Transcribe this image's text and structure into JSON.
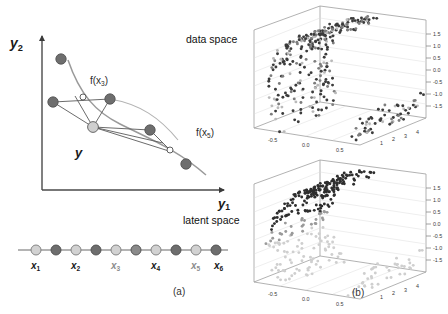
{
  "figure": {
    "caption_a": "(a)",
    "caption_b": "(b)"
  },
  "panel_a": {
    "title_data_space": "data space",
    "title_latent_space": "latent space",
    "axis_y2": "y",
    "axis_y2_sub": "2",
    "axis_y1": "y",
    "axis_y1_sub": "1",
    "point_y_label": "y",
    "map_label_1": "f(x",
    "map_label_1_sub": "3",
    "map_label_1_close": ")",
    "map_label_2": "f(x",
    "map_label_2_sub": "5",
    "map_label_2_close": ")",
    "latent_points": [
      {
        "label": "x",
        "sub": "1"
      },
      {
        "label": "x",
        "sub": "2"
      },
      {
        "label": "x",
        "sub": "3"
      },
      {
        "label": "x",
        "sub": "4"
      },
      {
        "label": "x",
        "sub": "5"
      },
      {
        "label": "x",
        "sub": "6"
      }
    ],
    "colors": {
      "data_point": "#6b6b6b",
      "projection_point": "#ffffff",
      "y_point": "#c9c9c9",
      "manifold_curve": "#8f8f8f",
      "axis": "#4a4a4a",
      "connector": "#5a5a5a"
    }
  },
  "chart_data": [
    {
      "type": "scatter",
      "name": "data-space-manifold-top",
      "title": "",
      "projection": "3d",
      "xlabel": "",
      "ylabel": "",
      "zlabel": "",
      "xticks": [
        "-0.5",
        "0.0",
        "0.5"
      ],
      "yticks": [
        "1",
        "2",
        "3",
        "4"
      ],
      "zticks": [
        "1.5",
        "1.0",
        "0.5",
        "0.0",
        "-0.5",
        "-1.0",
        "-1.5"
      ],
      "xlim": [
        -1.0,
        1.0
      ],
      "ylim": [
        0.0,
        4.5
      ],
      "zlim": [
        -1.8,
        1.8
      ],
      "grid": true,
      "legend": "none",
      "n_points": 480,
      "point_colors": [
        "#3b3b3b",
        "#7d7d7d",
        "#b9b9b9"
      ],
      "description": "Helical / swiss-roll shaped 3-D point cloud, mixed dark and light markers distributed uniformly along the manifold."
    },
    {
      "type": "scatter",
      "name": "data-space-manifold-bottom",
      "title": "",
      "projection": "3d",
      "xlabel": "",
      "ylabel": "",
      "zlabel": "",
      "xticks": [
        "-0.5",
        "0.0",
        "0.5"
      ],
      "yticks": [
        "1",
        "2",
        "3",
        "4"
      ],
      "zticks": [
        "1.5",
        "1.0",
        "0.5",
        "0.0",
        "-0.5",
        "-1.0",
        "-1.5"
      ],
      "xlim": [
        -1.0,
        1.0
      ],
      "ylim": [
        0.0,
        4.5
      ],
      "zlim": [
        -1.8,
        1.8
      ],
      "grid": true,
      "legend": "none",
      "n_points": 480,
      "point_colors": [
        "#2e2e2e",
        "#9a9a9a",
        "#cfcfcf"
      ],
      "description": "Same helical manifold, markers shaded by latent coordinate: dark points on the upper sheet, light points on the lower sheet."
    }
  ]
}
